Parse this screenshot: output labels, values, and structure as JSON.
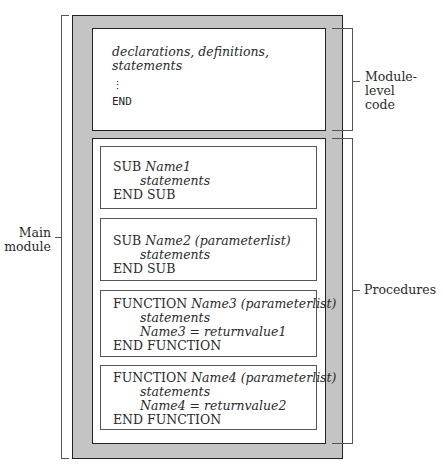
{
  "diagram": {
    "module_level": {
      "lines": [
        "declarations, definitions,",
        "statements"
      ],
      "ellipsis": "⋮",
      "end": "END"
    },
    "procedures": [
      {
        "keyword": "SUB",
        "signature": "Name1",
        "body": [
          "statements"
        ],
        "end": "END SUB"
      },
      {
        "keyword": "SUB",
        "signature": "Name2 (parameterlist)",
        "body": [
          "statements"
        ],
        "end": "END SUB"
      },
      {
        "keyword": "FUNCTION",
        "signature": "Name3 (parameterlist)",
        "body": [
          "statements",
          "Name3 = returnvalue1"
        ],
        "end": "END FUNCTION"
      },
      {
        "keyword": "FUNCTION",
        "signature": "Name4 (parameterlist)",
        "body": [
          "statements",
          "Name4 = returnvalue2"
        ],
        "end": "END FUNCTION"
      }
    ],
    "labels": {
      "main_module": [
        "Main",
        "module"
      ],
      "module_level_code": [
        "Module-level",
        "code"
      ],
      "procedures": "Procedures"
    },
    "colors": {
      "outer_fill": "#c4c4c4",
      "border": "#222222"
    }
  }
}
